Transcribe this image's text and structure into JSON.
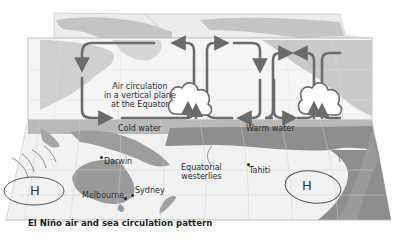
{
  "diagram": {
    "title": "El Niño air and sea circulation pattern",
    "annotation_air": {
      "line1": "Air circulation",
      "line2": "in a vertical plane",
      "line3": "at the Equator"
    },
    "water_labels": {
      "cold": "Cold water",
      "warm": "Warm water"
    },
    "winds": {
      "line1": "Equatorial",
      "line2": "westerlies"
    },
    "places": {
      "darwin": "Darwin",
      "sydney": "Sydney",
      "melbourne": "Melbourne",
      "tahiti": "Tahiti"
    },
    "pressure": {
      "left": "H",
      "right": "H"
    },
    "colors": {
      "land": "#a9a9a9",
      "sea": "#f2f2f2",
      "warm_band": "#8e8e8e",
      "cold_band": "#b9b9b9",
      "arrows": "#6b6b6b",
      "grid": "#c8c8c8"
    }
  }
}
